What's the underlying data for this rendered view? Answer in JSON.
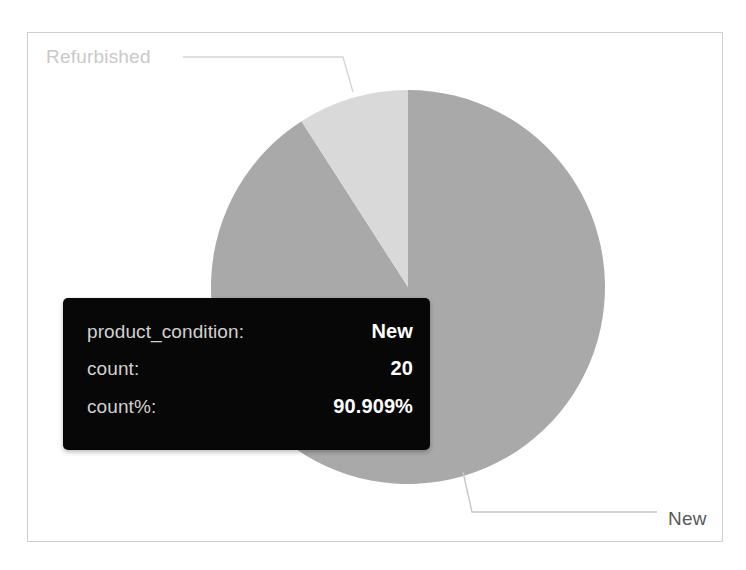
{
  "chart_data": {
    "type": "pie",
    "title": "",
    "category_field": "product_condition",
    "value_field": "count",
    "categories": [
      "New",
      "Refurbished"
    ],
    "values": [
      20,
      2
    ],
    "percents": [
      "90.909%",
      "9.091%"
    ],
    "total": 22,
    "colors": [
      "#a9a9a9",
      "#d9d9d9"
    ],
    "labels": [
      {
        "text": "New",
        "color": "#595959"
      },
      {
        "text": "Refurbished",
        "color": "#c9c9c9"
      }
    ],
    "legend": "none",
    "grid": false,
    "start_angle_deg": 0,
    "direction": "clockwise"
  },
  "frame": {
    "border_color": "#cfcfcf",
    "background": "#ffffff"
  },
  "labels": {
    "refurbished": "Refurbished",
    "new": "New"
  },
  "tooltip": {
    "background": "#070707",
    "rows": [
      {
        "key": "product_condition:",
        "value": "New"
      },
      {
        "key": "count:",
        "value": "20"
      },
      {
        "key": "count%:",
        "value": "90.909%"
      }
    ]
  }
}
